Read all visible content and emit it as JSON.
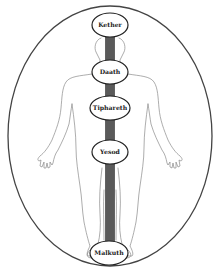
{
  "diagram": {
    "type": "middle-pillar-body-diagram",
    "colors": {
      "background": "#ffffff",
      "outline": "#444444",
      "body_outline": "#888888",
      "pillar": "#5a5a5a",
      "node_fill": "#ffffff",
      "text": "#222222"
    },
    "nodes": [
      {
        "label": "Kether",
        "cx": 110,
        "cy": 25,
        "rx": 18,
        "ry": 12
      },
      {
        "label": "Daath",
        "cx": 110,
        "cy": 72,
        "rx": 18,
        "ry": 12
      },
      {
        "label": "Tiphareth",
        "cx": 110,
        "cy": 108,
        "rx": 20,
        "ry": 12
      },
      {
        "label": "Yesod",
        "cx": 110,
        "cy": 152,
        "rx": 18,
        "ry": 12
      },
      {
        "label": "Malkuth",
        "cx": 109,
        "cy": 253,
        "rx": 19,
        "ry": 12
      }
    ]
  }
}
